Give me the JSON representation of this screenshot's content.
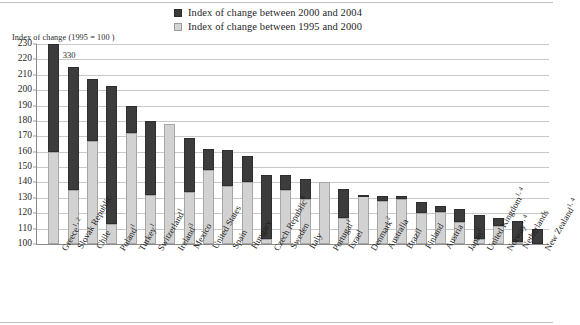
{
  "axis_title": "Index of change (1995 = 100 )",
  "legend": [
    {
      "label": "Index of change between 2000 and 2004",
      "swatch": "dark",
      "color": "#3a3a3a"
    },
    {
      "label": "Index of change between 1995 and 2000",
      "swatch": "light",
      "color": "#d4d4d4"
    }
  ],
  "chart_data": {
    "type": "bar",
    "title": "Index of change (1995 = 100 )",
    "subtitle": "",
    "xlabel": "",
    "ylabel": "Index of change (1995 = 100 )",
    "ylim": [
      100,
      230
    ],
    "ytick_step": 10,
    "yticks": [
      230,
      220,
      210,
      200,
      190,
      180,
      170,
      160,
      150,
      140,
      130,
      120,
      110,
      100
    ],
    "grid": true,
    "stacked": true,
    "legend_position": "top-center",
    "baseline": 100,
    "categories": [
      "Greece",
      "Slovak Republic",
      "Chile",
      "Poland",
      "Turkey",
      "Switzerland",
      "Ireland",
      "Mexico",
      "United States",
      "Spain",
      "Hungary",
      "Czech Republic",
      "Sweden",
      "Italy",
      "Portugal",
      "Israel",
      "Denmark",
      "Australia",
      "Brazil",
      "Finland",
      "Austria",
      "Japan",
      "United Kingdom",
      "Norway",
      "Netherlands",
      "New Zealand"
    ],
    "category_footnotes": [
      "1, 2",
      "",
      "",
      "1",
      "1",
      "1",
      "3",
      "",
      "",
      "",
      "",
      "4",
      "",
      "",
      "1",
      "",
      "2",
      "",
      "",
      "",
      "",
      "2",
      "1, 4",
      "1, 4",
      "",
      "1, 4"
    ],
    "series": [
      {
        "name": "Index of change between 1995 and 2000",
        "color": "#d2d2d2",
        "values": [
          160,
          135,
          167,
          113,
          172,
          132,
          178,
          134,
          148,
          138,
          140,
          103,
          135,
          129,
          140,
          117,
          131,
          128,
          129,
          120,
          121,
          114,
          103,
          112,
          101,
          100
        ]
      },
      {
        "name": "Index of change between 2000 and 2004",
        "color": "#3c3c3c",
        "values_cumulative_top": [
          230,
          215,
          207,
          203,
          190,
          180,
          178,
          169,
          162,
          161,
          157,
          145,
          145,
          142,
          140,
          136,
          132,
          131,
          131,
          127,
          125,
          123,
          119,
          117,
          115,
          110
        ]
      }
    ],
    "annotations": [
      {
        "text": "330",
        "category": "Greece",
        "note": "true bar top value, bar clipped at axis maximum"
      }
    ]
  }
}
